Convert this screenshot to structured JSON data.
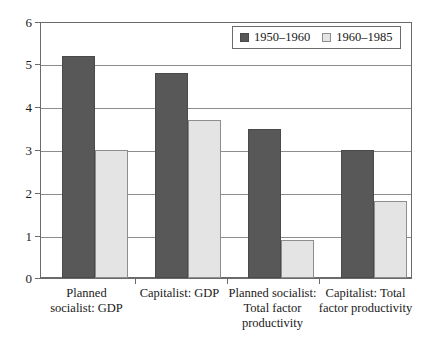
{
  "chart_data": {
    "type": "bar",
    "title": "",
    "subtitle": "",
    "xlabel": "",
    "ylabel": "",
    "ylim": [
      0,
      6
    ],
    "yticks": [
      0,
      1,
      2,
      3,
      4,
      5,
      6
    ],
    "ytick_labels": [
      "0",
      "1",
      "2",
      "3",
      "4",
      "5",
      "6"
    ],
    "grid": true,
    "legend_position": "top-right",
    "categories": [
      "Planned socialist: GDP",
      "Capitalist: GDP",
      "Planned socialist: Total factor productivity",
      "Capitalist: Total factor productivity"
    ],
    "category_lines": [
      [
        "Planned",
        "socialist: GDP"
      ],
      [
        "Capitalist: GDP"
      ],
      [
        "Planned socialist:",
        "Total factor",
        "productivity"
      ],
      [
        "Capitalist: Total",
        "factor productivity"
      ]
    ],
    "series": [
      {
        "name": "1950–1960",
        "color": "#585858",
        "values": [
          5.2,
          4.8,
          3.5,
          3.0
        ]
      },
      {
        "name": "1960–1985",
        "color": "#e3e4e3",
        "values": [
          3.0,
          3.7,
          0.9,
          1.8
        ]
      }
    ]
  },
  "legend": {
    "entries": [
      {
        "label": "1950–1960",
        "swatch": "dark-swatch-icon"
      },
      {
        "label": "1960–1985",
        "swatch": "light-swatch-icon"
      }
    ]
  },
  "colors": {
    "series_1950_1960": "#585858",
    "series_1960_1985": "#e3e4e3",
    "axis": "#6b6b6b",
    "gridline": "#8d8d8d",
    "background": "#ffffff",
    "text": "#1a1a1a"
  }
}
